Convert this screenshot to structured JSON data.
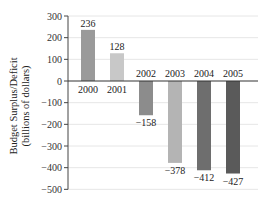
{
  "chart_data": {
    "type": "bar",
    "title": "",
    "xlabel": "",
    "ylabel": "Budget Surplus/Deficit",
    "ylabel_sub": "(billions of dollars)",
    "categories": [
      "2000",
      "2001",
      "2002",
      "2003",
      "2004",
      "2005"
    ],
    "values": [
      236,
      128,
      -158,
      -378,
      -412,
      -427
    ],
    "value_labels": [
      "236",
      "128",
      "−158",
      "−378",
      "−412",
      "−427"
    ],
    "bar_colors": [
      "#9a9a9a",
      "#c8c8c8",
      "#8c8c8c",
      "#b4b4b4",
      "#6e6e6e",
      "#5a5a5a"
    ],
    "ylim": [
      -500,
      300
    ],
    "yticks": [
      300,
      200,
      100,
      0,
      -100,
      -200,
      -300,
      -400,
      -500
    ],
    "ytick_labels": [
      "300",
      "200",
      "100",
      "0",
      "−100",
      "−200",
      "−300",
      "−400",
      "−500"
    ],
    "grid": true,
    "legend": null
  }
}
